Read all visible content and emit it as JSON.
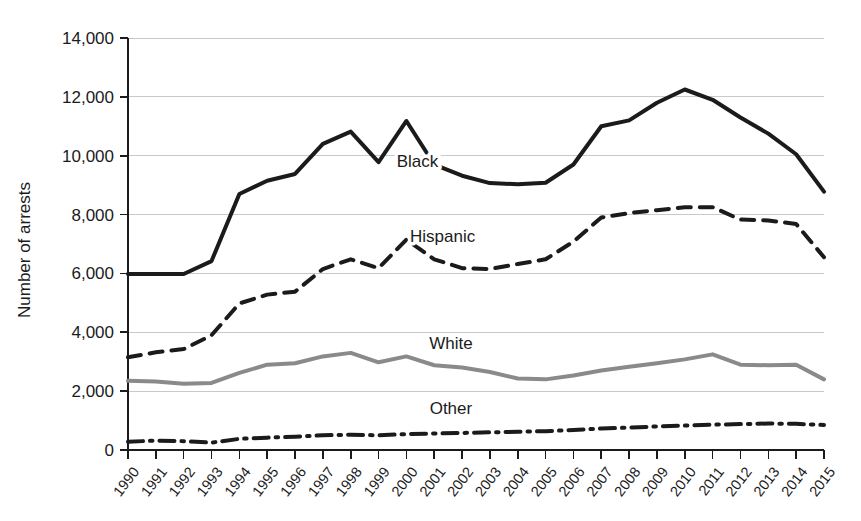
{
  "chart_data": {
    "type": "line",
    "title": "",
    "xlabel": "",
    "ylabel": "Number of arrests",
    "ylim": [
      0,
      14000
    ],
    "xlim": [
      1990,
      2015
    ],
    "grid": true,
    "legend_position": "inline-labels",
    "ytick_labels": [
      "0",
      "2,000",
      "4,000",
      "6,000",
      "8,000",
      "10,000",
      "12,000",
      "14,000"
    ],
    "ytick_values": [
      0,
      2000,
      4000,
      6000,
      8000,
      10000,
      12000,
      14000
    ],
    "categories": [
      "1990",
      "1991",
      "1992",
      "1993",
      "1994",
      "1995",
      "1996",
      "1997",
      "1998",
      "1999",
      "2000",
      "2001",
      "2002",
      "2003",
      "2004",
      "2005",
      "2006",
      "2007",
      "2008",
      "2009",
      "2010",
      "2011",
      "2012",
      "2013",
      "2014",
      "2015"
    ],
    "x": [
      1990,
      1991,
      1992,
      1993,
      1994,
      1995,
      1996,
      1997,
      1998,
      1999,
      2000,
      2001,
      2002,
      2003,
      2004,
      2005,
      2006,
      2007,
      2008,
      2009,
      2010,
      2011,
      2012,
      2013,
      2014,
      2015
    ],
    "series": [
      {
        "name": "Black",
        "style": "solid",
        "color": "#1b1b1b",
        "width": 4,
        "label_x": 2000.4,
        "label_y": 9600,
        "values": [
          5980,
          5980,
          5980,
          6420,
          8700,
          9150,
          9380,
          10400,
          10820,
          9780,
          11180,
          9700,
          9320,
          9070,
          9030,
          9080,
          9700,
          11000,
          11200,
          11800,
          12250,
          11900,
          11300,
          10750,
          10050,
          8780
        ]
      },
      {
        "name": "Hispanic",
        "style": "dashed",
        "color": "#1b1b1b",
        "width": 4,
        "label_x": 2001.3,
        "label_y": 7080,
        "values": [
          3150,
          3320,
          3430,
          3900,
          4980,
          5280,
          5380,
          6150,
          6480,
          6180,
          7150,
          6480,
          6180,
          6150,
          6320,
          6480,
          7080,
          7900,
          8050,
          8150,
          8250,
          8250,
          7830,
          7800,
          7680,
          6550
        ]
      },
      {
        "name": "White",
        "style": "solid",
        "color": "#8a8a8a",
        "width": 4,
        "label_x": 2001.6,
        "label_y": 3430,
        "values": [
          2350,
          2330,
          2250,
          2280,
          2620,
          2900,
          2950,
          3180,
          3300,
          2980,
          3180,
          2880,
          2800,
          2650,
          2430,
          2400,
          2530,
          2700,
          2830,
          2950,
          3080,
          3250,
          2900,
          2880,
          2900,
          2400
        ]
      },
      {
        "name": "Other",
        "style": "dashdot",
        "color": "#1b1b1b",
        "width": 4,
        "label_x": 2001.6,
        "label_y": 1220,
        "values": [
          280,
          320,
          300,
          250,
          380,
          420,
          450,
          500,
          520,
          500,
          540,
          560,
          580,
          600,
          620,
          640,
          680,
          730,
          760,
          800,
          830,
          860,
          880,
          900,
          890,
          850
        ]
      }
    ]
  }
}
